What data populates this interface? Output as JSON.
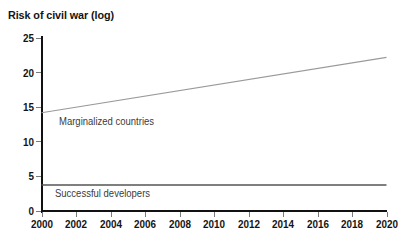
{
  "chart_data": {
    "type": "line",
    "title": "Risk of civil war (log)",
    "xlabel": "",
    "ylabel": "",
    "xlim": [
      2000,
      2020
    ],
    "ylim": [
      0,
      25
    ],
    "grid": false,
    "legend_position": "inline-annotations",
    "x_ticks": [
      "2000",
      "2002",
      "2004",
      "2006",
      "2008",
      "2010",
      "2012",
      "2014",
      "2016",
      "2018",
      "2020"
    ],
    "y_ticks": [
      "0",
      "5",
      "10",
      "15",
      "20",
      "25"
    ],
    "x": [
      2000,
      2020
    ],
    "series": [
      {
        "name": "Marginalized countries",
        "values": [
          14.2,
          22.2
        ],
        "color": "#9a9a9a"
      },
      {
        "name": "Successful developers",
        "values": [
          3.75,
          3.75
        ],
        "color": "#555555"
      }
    ]
  },
  "axis_color": "#111111",
  "tick_color": "#7a7a7a",
  "annotation_color": "#3b3b3b"
}
